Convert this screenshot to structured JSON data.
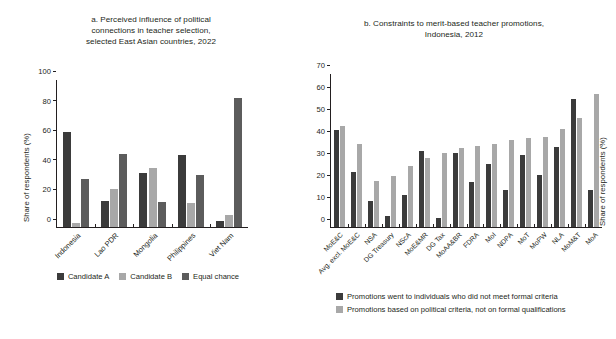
{
  "colors": {
    "dark": "#3b3b3b",
    "light": "#a8a8a8",
    "mid": "#5c5c5c",
    "axis": "#231f20"
  },
  "panel_a": {
    "title": "a. Perceived influence of political\nconnections in teacher selection,\nselected East Asian countries, 2022",
    "ylabel": "Share of respondents (%)",
    "yticks": [
      "0",
      "20",
      "40",
      "60",
      "80",
      "100"
    ],
    "legend": [
      {
        "label": "Candidate A",
        "color": "#3b3b3b"
      },
      {
        "label": "Candidate B",
        "color": "#a8a8a8"
      },
      {
        "label": "Equal chance",
        "color": "#5c5c5c"
      }
    ],
    "chart_data": {
      "type": "bar",
      "title": "a. Perceived influence of political connections in teacher selection, selected East Asian countries, 2022",
      "xlabel": "",
      "ylabel": "Share of respondents (%)",
      "ylim": [
        0,
        100
      ],
      "ytick_step": 20,
      "grid": false,
      "legend_position": "bottom",
      "categories": [
        "Indonesia",
        "Lao PDR",
        "Mongolia",
        "Philippines",
        "Viet Nam"
      ],
      "series": [
        {
          "name": "Candidate A",
          "color": "#3b3b3b",
          "values": [
            64.5,
            18,
            37,
            49,
            4
          ]
        },
        {
          "name": "Candidate B",
          "color": "#a8a8a8",
          "values": [
            3,
            26,
            40,
            16,
            8
          ]
        },
        {
          "name": "Equal chance",
          "color": "#5c5c5c",
          "values": [
            32.5,
            50,
            17,
            35.5,
            88
          ]
        }
      ]
    }
  },
  "panel_b": {
    "title": "b. Constraints to merit-based teacher promotions,\nIndonesia, 2012",
    "ylabel": "Share of respondents (%)",
    "yticks": [
      "0",
      "10",
      "20",
      "30",
      "40",
      "50",
      "60",
      "70"
    ],
    "legend": [
      {
        "label": "Promotions went to individuals who did not meet formal criteria",
        "color": "#3b3b3b"
      },
      {
        "label": "Promotions based on political criteria, not on formal qualifications",
        "color": "#a8a8a8"
      }
    ],
    "chart_data": {
      "type": "bar",
      "title": "b. Constraints to merit-based teacher promotions, Indonesia, 2012",
      "xlabel": "",
      "ylabel": "Share of respondents (%)",
      "ylim": [
        0,
        70
      ],
      "ytick_step": 10,
      "grid": false,
      "legend_position": "bottom",
      "categories": [
        "MoE&C",
        "Avg. excl. MoE&C",
        "NSA",
        "DG Treasury",
        "NScA",
        "MoE&MR",
        "DG Tax",
        "MoAA&BR",
        "FDRA",
        "MoI",
        "NDPA",
        "MoT",
        "MoPW",
        "NLA",
        "MoM&T",
        "MoA"
      ],
      "series": [
        {
          "name": "Promotions went to individuals who did not meet formal criteria",
          "color": "#3b3b3b",
          "values": [
            44.5,
            25,
            12,
            5,
            14.5,
            35,
            4,
            34,
            20.5,
            29,
            17,
            33,
            24,
            36.5,
            58.5,
            17
          ]
        },
        {
          "name": "Promotions based on political criteria, not on formal qualifications",
          "color": "#a8a8a8",
          "values": [
            46,
            38,
            21,
            23.5,
            28,
            31.5,
            34,
            36,
            37,
            38,
            40,
            40.5,
            41,
            45,
            50,
            61
          ]
        }
      ]
    }
  }
}
